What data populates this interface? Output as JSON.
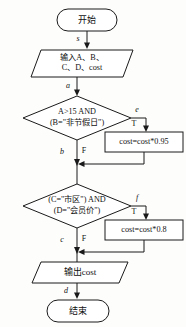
{
  "diagram": {
    "type": "flowchart",
    "orientation": "vertical",
    "language": "zh-CN",
    "nodes": {
      "start": {
        "shape": "terminator",
        "label": "开始"
      },
      "input": {
        "shape": "parallelogram",
        "line1": "输入A、B、",
        "line2": "C、D、cost"
      },
      "decision1": {
        "shape": "diamond",
        "line1": "A>15 AND",
        "line2": "(B=\"非节假日\")"
      },
      "process1": {
        "shape": "rectangle",
        "label": "cost=cost*0.95"
      },
      "decision2": {
        "shape": "diamond",
        "line1": "(C=\"市区\") AND",
        "line2": "(D=\"会员价\")"
      },
      "process2": {
        "shape": "rectangle",
        "label": "cost=cost*0.8"
      },
      "output": {
        "shape": "parallelogram",
        "label": "输出cost"
      },
      "end": {
        "shape": "terminator",
        "label": "结束"
      }
    },
    "edges": [
      {
        "id": "s",
        "label": "s",
        "from": "start",
        "to": "input"
      },
      {
        "id": "a",
        "label": "a",
        "from": "input",
        "to": "decision1"
      },
      {
        "id": "e",
        "label": "e",
        "from": "decision1",
        "to": "process1"
      },
      {
        "id": "b",
        "label": "b",
        "from": "decision1",
        "to": "decision2"
      },
      {
        "id": "f",
        "label": "f",
        "from": "decision2",
        "to": "process2"
      },
      {
        "id": "c",
        "label": "c",
        "from": "decision2",
        "to": "output"
      },
      {
        "id": "d",
        "label": "d",
        "from": "output",
        "to": "end"
      }
    ],
    "branch_labels": {
      "decision1_true": "T",
      "decision1_false": "F",
      "decision2_true": "T",
      "decision2_false": "F"
    },
    "colors": {
      "stroke": "#1a1a1a",
      "fill": "#ffffff",
      "background": "#fdfdfc",
      "text": "#111111"
    }
  }
}
